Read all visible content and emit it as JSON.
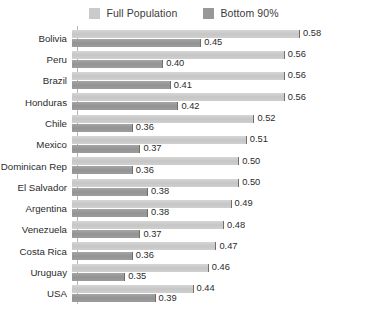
{
  "chart_data": {
    "type": "bar",
    "orientation": "horizontal",
    "title": "",
    "xlabel": "",
    "ylabel": "",
    "grid": false,
    "legend_position": "top-center",
    "axis_baseline_value": 0.28,
    "xlim": [
      0.28,
      0.6
    ],
    "categories": [
      "Bolivia",
      "Peru",
      "Brazil",
      "Honduras",
      "Chile",
      "Mexico",
      "Dominican Rep",
      "El Salvador",
      "Argentina",
      "Venezuela",
      "Costa Rica",
      "Uruguay",
      "USA"
    ],
    "series": [
      {
        "name": "Full Population",
        "color": "#cacaca",
        "values": [
          0.58,
          0.56,
          0.56,
          0.56,
          0.52,
          0.51,
          0.5,
          0.5,
          0.49,
          0.48,
          0.47,
          0.46,
          0.44
        ],
        "labels": [
          "0.58",
          "0.56",
          "0.56",
          "0.56",
          "0.52",
          "0.51",
          "0.50",
          "0.50",
          "0.49",
          "0.48",
          "0.47",
          "0.46",
          "0.44"
        ]
      },
      {
        "name": "Bottom 90%",
        "color": "#989898",
        "values": [
          0.45,
          0.4,
          0.41,
          0.42,
          0.36,
          0.37,
          0.36,
          0.38,
          0.38,
          0.37,
          0.36,
          0.35,
          0.39
        ],
        "labels": [
          "0.45",
          "0.40",
          "0.41",
          "0.42",
          "0.36",
          "0.37",
          "0.36",
          "0.38",
          "0.38",
          "0.37",
          "0.36",
          "0.35",
          "0.39"
        ]
      }
    ]
  },
  "legend": {
    "entries": [
      {
        "label": "Full Population",
        "swatch": "#cacaca"
      },
      {
        "label": "Bottom 90%",
        "swatch": "#989898"
      }
    ]
  }
}
